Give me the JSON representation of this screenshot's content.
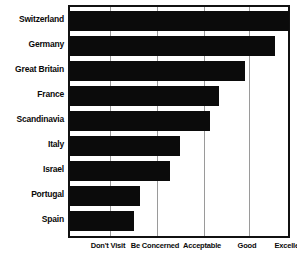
{
  "chart_data": {
    "type": "bar",
    "orientation": "horizontal",
    "title": "",
    "subtitle": "",
    "xlabel": "",
    "ylabel": "",
    "categories": [
      "Switzerland",
      "Germany",
      "Great Britain",
      "France",
      "Scandinavia",
      "Italy",
      "Israel",
      "Portugal",
      "Spain"
    ],
    "values": [
      4.98,
      4.67,
      4.0,
      3.45,
      3.25,
      2.6,
      2.4,
      1.75,
      1.6
    ],
    "xtick_labels": [
      "Don't Visit",
      "Be Concerned",
      "Acceptable",
      "Good",
      "Excellent"
    ],
    "xtick_values": [
      1,
      2,
      3,
      4,
      5
    ],
    "xlim": [
      0.12,
      5.02
    ],
    "grid": true,
    "grid_axis": "x",
    "legend": false,
    "bar_color": "#0b0b0b",
    "grid_color": "#9a9a9a",
    "axis_color": "#111111",
    "background_color": "#ffffff"
  },
  "layout": {
    "plot": {
      "left": 68,
      "top": 5,
      "width": 222,
      "height": 233
    },
    "bar_rows": [
      {
        "top": 4,
        "height": 20
      },
      {
        "top": 29,
        "height": 20
      },
      {
        "top": 54,
        "height": 20
      },
      {
        "top": 79,
        "height": 20
      },
      {
        "top": 104,
        "height": 20
      },
      {
        "top": 129,
        "height": 20
      },
      {
        "top": 154,
        "height": 20
      },
      {
        "top": 179,
        "height": 20
      },
      {
        "top": 204,
        "height": 20
      }
    ],
    "bar_widths": [
      219,
      205,
      175,
      149,
      140,
      110,
      100,
      70,
      64
    ],
    "gridline_x": [
      40,
      87,
      134,
      179
    ],
    "xtick_px": [
      108,
      155,
      202,
      247,
      290
    ],
    "cat_label_tops": [
      9,
      34,
      59,
      84,
      109,
      134,
      159,
      184,
      209
    ]
  }
}
